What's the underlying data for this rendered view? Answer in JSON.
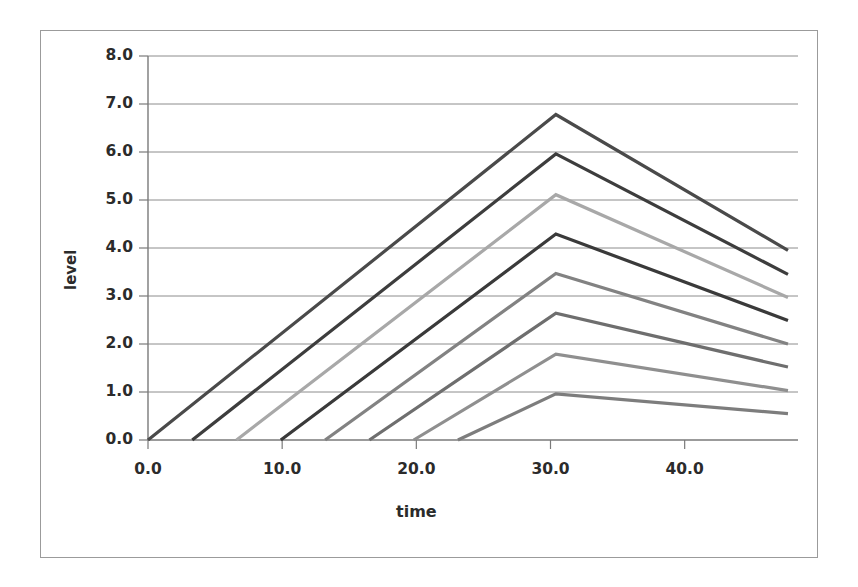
{
  "chart_data": {
    "type": "line",
    "title": "",
    "xlabel": "time",
    "ylabel": "level",
    "xlim": [
      0,
      48
    ],
    "ylim": [
      0,
      8
    ],
    "grid": true,
    "legend": "none",
    "xticks": [
      "0.0",
      "10.0",
      "20.0",
      "30.0",
      "40.0"
    ],
    "xtick_values": [
      0,
      10,
      20,
      30,
      40
    ],
    "yticks": [
      "0.0",
      "1.0",
      "2.0",
      "3.0",
      "4.0",
      "5.0",
      "6.0",
      "7.0",
      "8.0"
    ],
    "ytick_values": [
      0,
      1,
      2,
      3,
      4,
      5,
      6,
      7,
      8
    ],
    "series": [
      {
        "name": "series-1",
        "color": "#4a4a4a",
        "x": [
          0.0,
          30.4,
          47.7
        ],
        "y": [
          0.0,
          6.78,
          3.95
        ]
      },
      {
        "name": "series-2",
        "color": "#3d3d3d",
        "x": [
          3.3,
          30.4,
          47.7
        ],
        "y": [
          0.0,
          5.96,
          3.45
        ]
      },
      {
        "name": "series-3",
        "color": "#a8a8a8",
        "x": [
          6.6,
          30.4,
          47.7
        ],
        "y": [
          0.0,
          5.11,
          2.97
        ]
      },
      {
        "name": "series-4",
        "color": "#3a3a3a",
        "x": [
          9.9,
          30.4,
          47.7
        ],
        "y": [
          0.0,
          4.29,
          2.49
        ]
      },
      {
        "name": "series-5",
        "color": "#828282",
        "x": [
          13.2,
          30.4,
          47.7
        ],
        "y": [
          0.0,
          3.47,
          2.0
        ]
      },
      {
        "name": "series-6",
        "color": "#6e6e6e",
        "x": [
          16.5,
          30.4,
          47.7
        ],
        "y": [
          0.0,
          2.64,
          1.52
        ]
      },
      {
        "name": "series-7",
        "color": "#8f8f8f",
        "x": [
          19.8,
          30.4,
          47.7
        ],
        "y": [
          0.0,
          1.79,
          1.03
        ]
      },
      {
        "name": "series-8",
        "color": "#7d7d7d",
        "x": [
          23.1,
          30.4,
          47.7
        ],
        "y": [
          0.0,
          0.96,
          0.55
        ]
      }
    ]
  },
  "axes": {
    "y_title": "level",
    "x_title": "time"
  },
  "colors": {
    "frame_border": "#9b9b9b",
    "gridline": "#8c8c8c",
    "axis_line": "#7a7a7a",
    "tick_text": "#2b2b2b",
    "background": "#ffffff"
  }
}
